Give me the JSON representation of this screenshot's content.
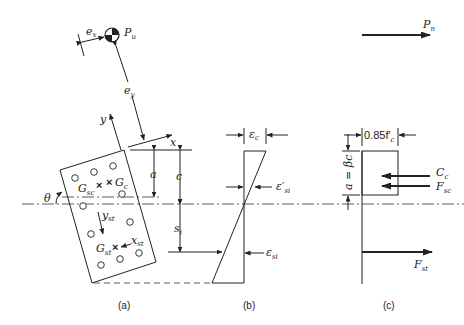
{
  "figure": {
    "panels": [
      {
        "id": "a",
        "caption": "(a)",
        "description": "Column cross-section rotated by angle theta with neutral axis"
      },
      {
        "id": "b",
        "caption": "(b)",
        "description": "Strain distribution"
      },
      {
        "id": "c",
        "caption": "(c)",
        "description": "Stress block and internal forces"
      }
    ],
    "labels": {
      "load": "P",
      "load_sub": "u",
      "ecc_x": "e",
      "ecc_x_sub": "x",
      "ecc_y": "e",
      "ecc_y_sub": "y",
      "axis_x": "x",
      "axis_y": "y",
      "theta": "θ",
      "g_sc": "G",
      "g_sc_sub": "sc",
      "g_c": "G",
      "g_c_sub": "c",
      "g_st": "G",
      "g_st_sub": "st",
      "y_st": "y",
      "y_st_sub": "st",
      "x_st": "x",
      "x_st_sub": "st",
      "dim_a": "a",
      "dim_c": "c",
      "dim_si": "s",
      "dim_si_sub": "i",
      "eps_c": "ε",
      "eps_c_sub": "c",
      "eps_si_prime": "ε′",
      "eps_si_prime_sub": "si",
      "eps_si": "ε",
      "eps_si_sub": "si",
      "stress": "0.85f′",
      "stress_sub": "c",
      "block_depth": "a = βc",
      "force_cc": "C",
      "force_cc_sub": "c",
      "force_fsc": "F",
      "force_fsc_sub": "sc",
      "force_fst": "F",
      "force_fst_sub": "st",
      "force_pn": "P",
      "force_pn_sub": "n"
    }
  }
}
